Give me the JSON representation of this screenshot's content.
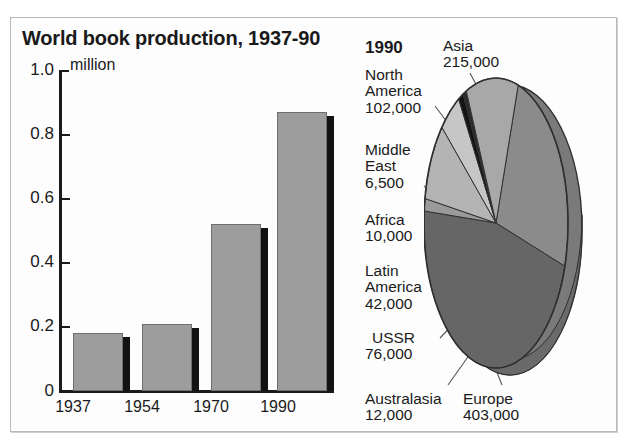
{
  "bar_chart": {
    "title": "World book production, 1937-90",
    "unit": "million",
    "y_ticks": [
      "1.0",
      "0.8",
      "0.6",
      "0.4",
      "0.2",
      "0"
    ],
    "x_labels": [
      "1937",
      "1954",
      "1970",
      "1990"
    ]
  },
  "pie_chart": {
    "year": "1990",
    "labels": {
      "asia": {
        "name": "Asia",
        "value": "215,000"
      },
      "north_america": {
        "name": "North\nAmerica",
        "name_line1": "North",
        "name_line2": "America",
        "value": "102,000"
      },
      "middle_east": {
        "name_line1": "Middle",
        "name_line2": "East",
        "value": "6,500"
      },
      "africa": {
        "name": "Africa",
        "value": "10,000"
      },
      "latin_america": {
        "name_line1": "Latin",
        "name_line2": "America",
        "value": "42,000"
      },
      "ussr": {
        "name": "USSR",
        "value": "76,000"
      },
      "australasia": {
        "name": "Australasia",
        "value": "12,000"
      },
      "europe": {
        "name": "Europe",
        "value": "403,000"
      }
    }
  },
  "colors": {
    "bar_fill": "#9d9d9d",
    "bar_shadow": "#121212",
    "axis": "#1a1a1a",
    "pie_asia": "#8b8b8b",
    "pie_europe": "#666666",
    "pie_north_america": "#a8a8a8",
    "pie_middle_east": "#2a2a2a",
    "pie_africa": "#141414",
    "pie_latin_america": "#c6c6c6",
    "pie_ussr": "#b4b4b4",
    "pie_australasia": "#9a9a9a",
    "pie_side": "#7a7a7a",
    "frame_border": "#b9b9b9"
  },
  "chart_data": [
    {
      "type": "bar",
      "title": "World book production, 1937-90",
      "xlabel": "",
      "ylabel": "million",
      "categories": [
        "1937",
        "1954",
        "1970",
        "1990"
      ],
      "values": [
        0.18,
        0.21,
        0.52,
        0.87
      ],
      "ylim": [
        0,
        1.0
      ],
      "yticks": [
        0,
        0.2,
        0.4,
        0.6,
        0.8,
        1.0
      ],
      "grid": false,
      "legend": "none"
    },
    {
      "type": "pie",
      "title": "1990",
      "labels": [
        "Asia",
        "Europe",
        "North America",
        "USSR",
        "Latin America",
        "Australasia",
        "Africa",
        "Middle East"
      ],
      "values": [
        215000,
        403000,
        102000,
        76000,
        42000,
        12000,
        10000,
        6500
      ],
      "total": 866500,
      "legend": "callout-labels",
      "three_d": true
    }
  ]
}
